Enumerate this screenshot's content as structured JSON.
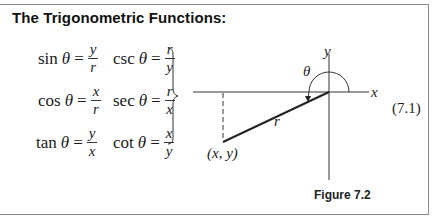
{
  "title": "The Trigonometric Functions:",
  "formulas": [
    {
      "fn": "sin",
      "var": "θ",
      "eq": "=",
      "num": "y",
      "den": "r"
    },
    {
      "fn": "csc",
      "var": "θ",
      "eq": "=",
      "num": "r",
      "den": "y"
    },
    {
      "fn": "cos",
      "var": "θ",
      "eq": "=",
      "num": "x",
      "den": "r"
    },
    {
      "fn": "sec",
      "var": "θ",
      "eq": "=",
      "num": "r",
      "den": "x"
    },
    {
      "fn": "tan",
      "var": "θ",
      "eq": "=",
      "num": "y",
      "den": "x"
    },
    {
      "fn": "cot",
      "var": "θ",
      "eq": "=",
      "num": "x",
      "den": "y"
    }
  ],
  "equation_number": "(7.1)",
  "diagram": {
    "x_axis_label": "x",
    "y_axis_label": "y",
    "angle_label": "θ",
    "radius_label": "r",
    "point_label": "(x, y)"
  },
  "figure_caption": "Figure 7.2"
}
